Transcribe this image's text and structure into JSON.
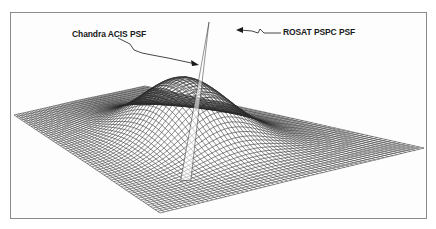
{
  "figure": {
    "type": "3d-surface-wireframe",
    "labels": {
      "chandra": "Chandra ACIS PSF",
      "rosat": "ROSAT PSPC PSF"
    },
    "colors": {
      "mesh": "#2b2b2b",
      "frame": "#8a8a8a",
      "background": "#ffffff",
      "text": "#1a1a1a"
    },
    "geometry": {
      "corner_left": [
        14,
        115
      ],
      "corner_back": [
        145,
        86
      ],
      "corner_right": [
        424,
        148
      ],
      "corner_front": [
        160,
        213
      ],
      "peak": [
        209,
        22
      ],
      "grid": 60,
      "rosat_height": 62,
      "rosat_width": 0.16,
      "chandra_height": 64,
      "chandra_width": 0.018
    }
  }
}
